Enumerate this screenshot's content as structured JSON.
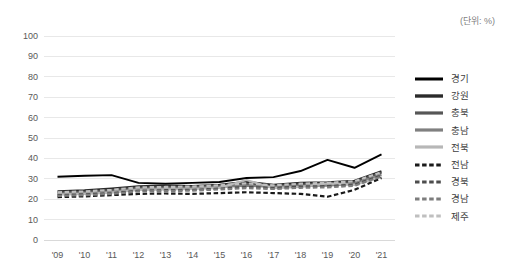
{
  "unit_note": "(단위: %)",
  "legend": {
    "position": "right",
    "items": [
      {
        "label": "경기",
        "color": "#000000",
        "style": "solid",
        "width": 1.9
      },
      {
        "label": "강원",
        "color": "#2b2b2b",
        "style": "solid",
        "width": 2.4
      },
      {
        "label": "충북",
        "color": "#565656",
        "style": "solid",
        "width": 2.2
      },
      {
        "label": "충남",
        "color": "#808080",
        "style": "solid",
        "width": 2.2
      },
      {
        "label": "전북",
        "color": "#b7b7b7",
        "style": "solid",
        "width": 2.2
      },
      {
        "label": "전남",
        "color": "#1a1a1a",
        "style": "dotted",
        "width": 2.2
      },
      {
        "label": "경북",
        "color": "#4d4d4d",
        "style": "dotted",
        "width": 2.2
      },
      {
        "label": "경남",
        "color": "#7d7d7d",
        "style": "dotted",
        "width": 2.2
      },
      {
        "label": "제주",
        "color": "#bfbfbf",
        "style": "dotted",
        "width": 2.2
      }
    ]
  },
  "chart_data": {
    "type": "line",
    "title": "",
    "subtitle": "",
    "xlabel": "",
    "ylabel": "",
    "unit": "%",
    "ylim": [
      0,
      100
    ],
    "ytick_step": 10,
    "yticks": [
      0,
      10,
      20,
      30,
      40,
      50,
      60,
      70,
      80,
      90,
      100
    ],
    "grid": true,
    "grid_axis": "y",
    "legend_position": "right",
    "categories": [
      "'09",
      "'10",
      "'11",
      "'12",
      "'13",
      "'14",
      "'15",
      "'16",
      "'17",
      "'18",
      "'19",
      "'20",
      "'21"
    ],
    "series": [
      {
        "name": "경기",
        "values": [
          31.0,
          31.5,
          31.8,
          28.0,
          27.6,
          28.0,
          28.4,
          30.4,
          30.8,
          33.8,
          39.3,
          35.4,
          42.0
        ]
      },
      {
        "name": "강원",
        "values": [
          23.8,
          24.3,
          25.2,
          26.2,
          26.6,
          26.4,
          27.0,
          28.4,
          27.0,
          28.0,
          28.2,
          29.0,
          33.6
        ]
      },
      {
        "name": "충북",
        "values": [
          23.2,
          23.6,
          24.4,
          25.6,
          25.8,
          26.0,
          26.6,
          27.4,
          26.4,
          27.2,
          27.6,
          28.4,
          33.0
        ]
      },
      {
        "name": "충남",
        "values": [
          22.6,
          23.0,
          23.6,
          25.0,
          25.2,
          25.4,
          26.0,
          26.6,
          26.0,
          26.6,
          26.6,
          27.6,
          32.0
        ]
      },
      {
        "name": "전북",
        "values": [
          22.2,
          22.6,
          23.2,
          24.6,
          24.8,
          25.0,
          25.6,
          29.4,
          25.4,
          26.0,
          27.8,
          27.0,
          31.0
        ]
      },
      {
        "name": "전남",
        "values": [
          21.0,
          21.4,
          22.0,
          22.6,
          22.8,
          22.6,
          23.0,
          23.4,
          23.0,
          22.6,
          21.2,
          24.6,
          30.4
        ]
      },
      {
        "name": "경북",
        "values": [
          22.0,
          22.4,
          23.0,
          24.2,
          24.4,
          24.6,
          25.2,
          26.0,
          25.6,
          26.2,
          26.4,
          27.2,
          31.6
        ]
      },
      {
        "name": "경남",
        "values": [
          21.6,
          22.0,
          22.6,
          23.8,
          24.0,
          24.2,
          24.8,
          25.4,
          25.0,
          25.6,
          25.8,
          26.6,
          31.2
        ]
      },
      {
        "name": "제주",
        "values": [
          23.4,
          23.8,
          24.6,
          25.8,
          26.0,
          26.2,
          26.8,
          27.8,
          26.8,
          27.6,
          28.0,
          28.8,
          33.2
        ]
      }
    ]
  }
}
